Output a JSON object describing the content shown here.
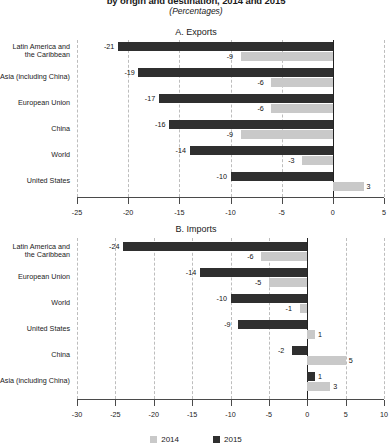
{
  "chart": {
    "title": "by origin and destination, 2014 and 2015",
    "subtitle": "(Percentages)"
  },
  "legend": {
    "items": [
      {
        "label": "2014",
        "color": "#c9c9c9"
      },
      {
        "label": "2015",
        "color": "#2f2f2f"
      }
    ]
  },
  "panels": [
    {
      "key": "exports",
      "title": "A. Exports"
    },
    {
      "key": "imports",
      "title": "B. Imports"
    }
  ],
  "chart_data": [
    {
      "type": "bar",
      "title": "A. Exports",
      "orientation": "horizontal",
      "xlabel": "",
      "ylabel": "",
      "xlim": [
        -25,
        5
      ],
      "xticks": [
        -25,
        -20,
        -15,
        -10,
        -5,
        0,
        5
      ],
      "xticklabels": [
        "-25",
        "-20",
        "-15",
        "-10",
        "-5",
        "0",
        "5"
      ],
      "grid": true,
      "legend_position": "bottom",
      "categories": [
        "Latin America and the Caribbean",
        "Asia (including China)",
        "European Union",
        "China",
        "World",
        "United States"
      ],
      "category_lines": [
        [
          "Latin America and",
          "the Caribbean"
        ],
        [
          "Asia (including China)"
        ],
        [
          "European Union"
        ],
        [
          "China"
        ],
        [
          "World"
        ],
        [
          "United States"
        ]
      ],
      "series": [
        {
          "name": "2015",
          "color": "#2f2f2f",
          "values": [
            -21,
            -19,
            -17,
            -16,
            -14,
            -10
          ]
        },
        {
          "name": "2014",
          "color": "#c9c9c9",
          "values": [
            -9,
            -6,
            -6,
            -9,
            -3,
            3
          ]
        }
      ]
    },
    {
      "type": "bar",
      "title": "B. Imports",
      "orientation": "horizontal",
      "xlabel": "",
      "ylabel": "",
      "xlim": [
        -30,
        10
      ],
      "xticks": [
        -30,
        -25,
        -20,
        -15,
        -10,
        -5,
        0,
        5,
        10
      ],
      "xticklabels": [
        "-30",
        "-25",
        "-20",
        "-15",
        "-10",
        "-5",
        "0",
        "5",
        "10"
      ],
      "grid": true,
      "legend_position": "bottom",
      "categories": [
        "Latin America and the Caribbean",
        "European Union",
        "World",
        "United States",
        "China",
        "Asia (including China)"
      ],
      "category_lines": [
        [
          "Latin America and",
          "the Caribbean"
        ],
        [
          "European Union"
        ],
        [
          "World"
        ],
        [
          "United States"
        ],
        [
          "China"
        ],
        [
          "Asia (including China)"
        ]
      ],
      "series": [
        {
          "name": "2015",
          "color": "#2f2f2f",
          "values": [
            -24,
            -14,
            -10,
            -9,
            -2,
            1
          ]
        },
        {
          "name": "2014",
          "color": "#c9c9c9",
          "values": [
            -6,
            -5,
            -1,
            1,
            5,
            3
          ]
        }
      ]
    }
  ]
}
